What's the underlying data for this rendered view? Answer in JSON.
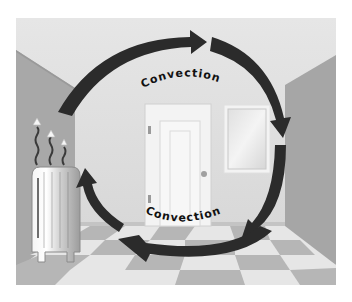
{
  "illustration": {
    "subject": "Convection currents in a heated room",
    "labels": {
      "top": "Convection",
      "bottom": "Convection"
    },
    "objects": {
      "heater": "radiator",
      "door": "door",
      "window": "window",
      "floor": "checkerboard-floor"
    },
    "colors": {
      "back_wall": "#d9d9d9",
      "side_wall": "#a9a9a9",
      "ceiling": "#e4e4e4",
      "arrow": "#2b2b2b",
      "floor_light": "#e6e6e6",
      "floor_dark": "#b4b4b4",
      "door": "#f2f2f2",
      "label_text": "#111111"
    },
    "arrows": [
      {
        "id": "top",
        "direction": "right"
      },
      {
        "id": "right",
        "direction": "down"
      },
      {
        "id": "bottom",
        "direction": "left"
      },
      {
        "id": "left",
        "direction": "up"
      }
    ]
  }
}
